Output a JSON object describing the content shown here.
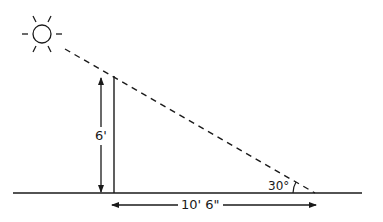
{
  "diagram": {
    "colors": {
      "stroke": "#1a1a1a",
      "background": "#ffffff"
    },
    "sun": {
      "icon": "sun-icon",
      "center": [
        42,
        34
      ],
      "radius": 9,
      "ray_count": 8
    },
    "ground": {
      "x1": 13,
      "y": 193,
      "x2": 362
    },
    "pole": {
      "x": 114,
      "top": 76,
      "bottom": 193
    },
    "sun_ray": {
      "style": "dashed",
      "from": [
        64,
        49
      ],
      "to": [
        315,
        193
      ]
    },
    "labels": {
      "height": "6'",
      "shadow_length": "10' 6\"",
      "angle": "30°"
    },
    "dimensions": {
      "height_arrow": {
        "x": 101,
        "y1": 78,
        "y2": 192
      },
      "length_arrow": {
        "y": 205,
        "x1": 112,
        "x2": 316
      }
    }
  }
}
